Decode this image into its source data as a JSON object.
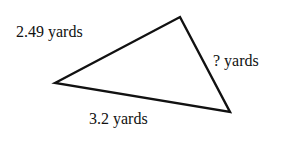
{
  "diagram": {
    "type": "triangle",
    "vertices": [
      [
        55,
        83
      ],
      [
        180,
        17
      ],
      [
        230,
        112
      ]
    ],
    "stroke_color": "#111111",
    "labels": {
      "side_a": "2.49 yards",
      "side_b": "? yards",
      "side_c": "3.2 yards"
    }
  }
}
